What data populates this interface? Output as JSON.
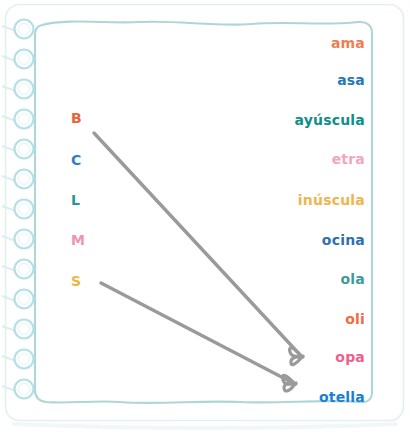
{
  "sheet": {
    "background_color": "#ffffff",
    "paper_color": "#ffffff",
    "border_color": "#bfdfdd",
    "outer_border_color": "#d9ecea",
    "spiral_ring_color": "#b9e0e6",
    "spiral_ring_fill": "#ffffff",
    "spiral_ring_count": 13,
    "style_name": "spiral-notebook-page"
  },
  "exercise": {
    "type": "match-the-pairs",
    "instruction": "",
    "left_column": {
      "name": "uppercase-letters",
      "items": [
        {
          "id": "b",
          "label": "B",
          "color": "#e8633c",
          "x": 71,
          "y": 111
        },
        {
          "id": "c",
          "label": "C",
          "color": "#2f7fc4",
          "x": 71,
          "y": 153
        },
        {
          "id": "l",
          "label": "L",
          "color": "#1f9b8e",
          "x": 71,
          "y": 193
        },
        {
          "id": "m",
          "label": "M",
          "color": "#ef93b4",
          "x": 71,
          "y": 233
        },
        {
          "id": "s",
          "label": "S",
          "color": "#f0b642",
          "x": 71,
          "y": 274
        }
      ]
    },
    "right_column": {
      "name": "word-endings",
      "items": [
        {
          "id": "ama",
          "label": "ama",
          "color": "#ef7d54",
          "y": 36
        },
        {
          "id": "asa",
          "label": "asa",
          "color": "#2878b5",
          "y": 73
        },
        {
          "id": "ayuscula",
          "label": "ayúscula",
          "color": "#0f8f8b",
          "y": 113
        },
        {
          "id": "etra",
          "label": "etra",
          "color": "#f4a6bd",
          "y": 152
        },
        {
          "id": "inuscula",
          "label": "inúscula",
          "color": "#f0b451",
          "y": 193
        },
        {
          "id": "ocina",
          "label": "ocina",
          "color": "#2f6fb0",
          "y": 233
        },
        {
          "id": "ola",
          "label": "ola",
          "color": "#3f9a9b",
          "y": 272
        },
        {
          "id": "oli",
          "label": "oli",
          "color": "#ef6a45",
          "y": 312
        },
        {
          "id": "opa",
          "label": "opa",
          "color": "#ee5f8e",
          "y": 350
        },
        {
          "id": "otella",
          "label": "otella",
          "color": "#1a7fd4",
          "y": 390
        }
      ]
    },
    "connections": [
      {
        "id": "b-to-opa",
        "from": "b",
        "to": "opa",
        "color": "#9a9a9a",
        "x1": 94,
        "y1": 133,
        "x2": 300,
        "y2": 356
      },
      {
        "id": "s-to-otella",
        "from": "s",
        "to": "otella",
        "color": "#9a9a9a",
        "x1": 101,
        "y1": 283,
        "x2": 293,
        "y2": 383
      }
    ],
    "drawn_connection_count": 2
  }
}
